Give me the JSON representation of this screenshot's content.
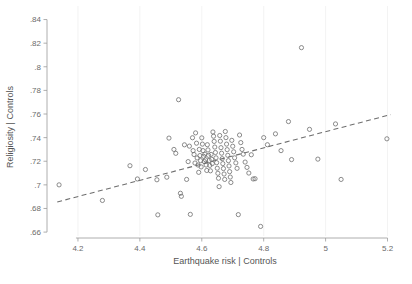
{
  "chart_data": {
    "type": "scatter",
    "title": "",
    "xlabel": "Earthquake risk | Controls",
    "ylabel": "Religiosity | Controls",
    "xlim": [
      4.1,
      5.25
    ],
    "ylim": [
      0.655,
      0.843
    ],
    "xticks": [
      4.2,
      4.4,
      4.6,
      4.8,
      5.0,
      5.2
    ],
    "xticklabels": [
      "4.2",
      "4.4",
      "4.6",
      "4.8",
      "5",
      "5.2"
    ],
    "yticks": [
      0.66,
      0.68,
      0.7,
      0.72,
      0.74,
      0.76,
      0.78,
      0.8,
      0.82,
      0.84
    ],
    "yticklabels": [
      ".66",
      ".68",
      ".7",
      ".72",
      ".74",
      ".76",
      ".78",
      ".8",
      ".82",
      ".84"
    ],
    "grid": "faint-vertical",
    "legend": "none",
    "marker_style": "open-circle",
    "fit_line": {
      "style": "dashed",
      "x_start": 4.133,
      "y_start": 0.6855,
      "x_end": 5.21,
      "y_end": 0.7595
    },
    "points": [
      [
        4.139,
        0.7
      ],
      [
        4.279,
        0.6868
      ],
      [
        4.368,
        0.7162
      ],
      [
        4.418,
        0.713
      ],
      [
        4.392,
        0.705
      ],
      [
        4.455,
        0.7043
      ],
      [
        4.458,
        0.6746
      ],
      [
        4.487,
        0.7065
      ],
      [
        4.494,
        0.7396
      ],
      [
        4.51,
        0.73
      ],
      [
        4.516,
        0.7267
      ],
      [
        4.525,
        0.7721
      ],
      [
        4.531,
        0.6929
      ],
      [
        4.534,
        0.6903
      ],
      [
        4.544,
        0.7339
      ],
      [
        4.551,
        0.7046
      ],
      [
        4.556,
        0.7197
      ],
      [
        4.56,
        0.7328
      ],
      [
        4.563,
        0.675
      ],
      [
        4.57,
        0.7399
      ],
      [
        4.572,
        0.729
      ],
      [
        4.575,
        0.7257
      ],
      [
        4.578,
        0.7185
      ],
      [
        4.58,
        0.744
      ],
      [
        4.583,
        0.7353
      ],
      [
        4.585,
        0.7228
      ],
      [
        4.588,
        0.7168
      ],
      [
        4.59,
        0.7106
      ],
      [
        4.592,
        0.73
      ],
      [
        4.594,
        0.7248
      ],
      [
        4.596,
        0.7205
      ],
      [
        4.598,
        0.7152
      ],
      [
        4.6,
        0.7398
      ],
      [
        4.602,
        0.7345
      ],
      [
        4.604,
        0.729
      ],
      [
        4.606,
        0.7242
      ],
      [
        4.608,
        0.7198
      ],
      [
        4.61,
        0.726
      ],
      [
        4.612,
        0.7212
      ],
      [
        4.614,
        0.7168
      ],
      [
        4.616,
        0.7122
      ],
      [
        4.618,
        0.734
      ],
      [
        4.62,
        0.7296
      ],
      [
        4.622,
        0.725
      ],
      [
        4.624,
        0.7207
      ],
      [
        4.626,
        0.7165
      ],
      [
        4.628,
        0.7119
      ],
      [
        4.63,
        0.7258
      ],
      [
        4.632,
        0.7216
      ],
      [
        4.634,
        0.718
      ],
      [
        4.636,
        0.7448
      ],
      [
        4.638,
        0.7412
      ],
      [
        4.64,
        0.7368
      ],
      [
        4.642,
        0.732
      ],
      [
        4.644,
        0.7274
      ],
      [
        4.646,
        0.7229
      ],
      [
        4.648,
        0.7188
      ],
      [
        4.65,
        0.7141
      ],
      [
        4.652,
        0.7098
      ],
      [
        4.654,
        0.7056
      ],
      [
        4.656,
        0.6985
      ],
      [
        4.658,
        0.7418
      ],
      [
        4.66,
        0.737
      ],
      [
        4.662,
        0.7315
      ],
      [
        4.664,
        0.7268
      ],
      [
        4.666,
        0.7222
      ],
      [
        4.668,
        0.718
      ],
      [
        4.67,
        0.7138
      ],
      [
        4.672,
        0.7092
      ],
      [
        4.674,
        0.7046
      ],
      [
        4.676,
        0.7452
      ],
      [
        4.678,
        0.74
      ],
      [
        4.68,
        0.7345
      ],
      [
        4.682,
        0.7298
      ],
      [
        4.684,
        0.725
      ],
      [
        4.686,
        0.7205
      ],
      [
        4.688,
        0.716
      ],
      [
        4.69,
        0.7112
      ],
      [
        4.692,
        0.7066
      ],
      [
        4.694,
        0.702
      ],
      [
        4.697,
        0.7377
      ],
      [
        4.7,
        0.7327
      ],
      [
        4.703,
        0.728
      ],
      [
        4.706,
        0.7229
      ],
      [
        4.71,
        0.7186
      ],
      [
        4.714,
        0.714
      ],
      [
        4.718,
        0.6748
      ],
      [
        4.722,
        0.7422
      ],
      [
        4.726,
        0.7358
      ],
      [
        4.73,
        0.73
      ],
      [
        4.734,
        0.726
      ],
      [
        4.74,
        0.7193
      ],
      [
        4.746,
        0.7148
      ],
      [
        4.752,
        0.71
      ],
      [
        4.76,
        0.7255
      ],
      [
        4.766,
        0.705
      ],
      [
        4.772,
        0.7052
      ],
      [
        4.79,
        0.6648
      ],
      [
        4.8,
        0.74
      ],
      [
        4.812,
        0.734
      ],
      [
        4.838,
        0.7432
      ],
      [
        4.856,
        0.729
      ],
      [
        4.88,
        0.7536
      ],
      [
        4.89,
        0.7214
      ],
      [
        4.922,
        0.8162
      ],
      [
        4.948,
        0.747
      ],
      [
        4.975,
        0.7218
      ],
      [
        5.032,
        0.7516
      ],
      [
        5.05,
        0.7046
      ],
      [
        5.198,
        0.739
      ]
    ]
  }
}
